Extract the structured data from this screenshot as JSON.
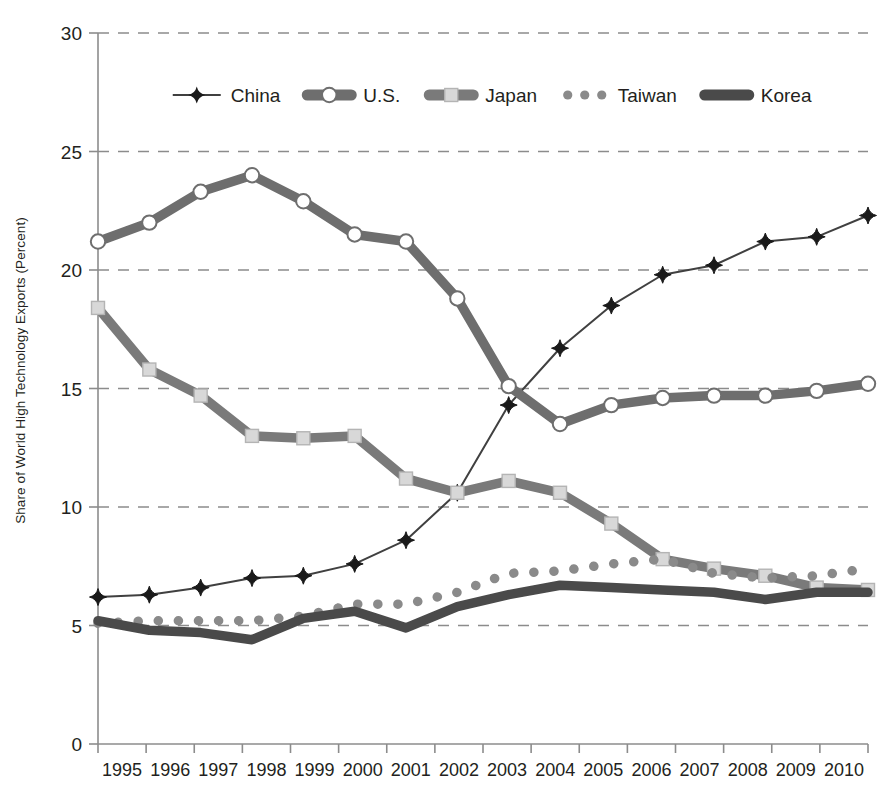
{
  "chart_data": {
    "type": "line",
    "title": "",
    "xlabel": "",
    "ylabel": "Share of World High Technology Exports (Percent)",
    "categories": [
      "1995",
      "1996",
      "1997",
      "1998",
      "1999",
      "2000",
      "2001",
      "2002",
      "2003",
      "2004",
      "2005",
      "2006",
      "2007",
      "2008",
      "2009",
      "2010"
    ],
    "x": [
      1995,
      1996,
      1997,
      1998,
      1999,
      2000,
      2001,
      2002,
      2003,
      2004,
      2005,
      2006,
      2007,
      2008,
      2009,
      2010
    ],
    "ylim": [
      0,
      30
    ],
    "xlim": [
      1995,
      2010
    ],
    "yticks": [
      0,
      5,
      10,
      15,
      20,
      25,
      30
    ],
    "ytick_labels": [
      "0",
      "5",
      "10",
      "15",
      "20",
      "25",
      "30"
    ],
    "grid": "horizontal-dashed",
    "legend_position": "top-center",
    "series": [
      {
        "name": "China",
        "color": "#404040",
        "marker": "diamond",
        "line_style": "thin-solid",
        "values": [
          6.2,
          6.3,
          6.6,
          7.0,
          7.1,
          7.6,
          8.6,
          10.6,
          14.3,
          16.7,
          18.5,
          19.8,
          20.2,
          21.2,
          21.4,
          22.3
        ]
      },
      {
        "name": "U.S.",
        "color": "#6e6e6e",
        "marker": "open-circle",
        "line_style": "thick-solid",
        "values": [
          21.2,
          22.0,
          23.3,
          24.0,
          22.9,
          21.5,
          21.2,
          18.8,
          15.1,
          13.5,
          14.3,
          14.6,
          14.7,
          14.7,
          14.9,
          15.2
        ]
      },
      {
        "name": "Japan",
        "color": "#7a7a7a",
        "marker": "square",
        "line_style": "thick-solid",
        "values": [
          18.4,
          15.8,
          14.7,
          13.0,
          12.9,
          13.0,
          11.2,
          10.6,
          11.1,
          10.6,
          9.3,
          7.8,
          7.4,
          7.1,
          6.6,
          6.5
        ]
      },
      {
        "name": "Taiwan",
        "color": "#8a8a8a",
        "marker": "dot",
        "line_style": "dotted",
        "values": [
          5.1,
          5.2,
          5.2,
          5.2,
          5.4,
          5.9,
          5.9,
          6.4,
          7.2,
          7.3,
          7.6,
          7.8,
          7.2,
          7.0,
          7.1,
          7.4
        ]
      },
      {
        "name": "Korea",
        "color": "#4a4a4a",
        "marker": "none",
        "line_style": "very-thick-solid",
        "values": [
          5.2,
          4.8,
          4.7,
          4.4,
          5.3,
          5.6,
          4.9,
          5.8,
          6.3,
          6.7,
          6.6,
          6.5,
          6.4,
          6.1,
          6.4,
          6.4
        ]
      }
    ]
  },
  "axis": {
    "y_title": "Share of World High Technology Exports (Percent)"
  },
  "legend": {
    "items": [
      {
        "label": "China"
      },
      {
        "label": "U.S."
      },
      {
        "label": "Japan"
      },
      {
        "label": "Taiwan"
      },
      {
        "label": "Korea"
      }
    ]
  },
  "colors": {
    "china": "#404040",
    "us": "#6e6e6e",
    "japan": "#7a7a7a",
    "taiwan": "#8a8a8a",
    "korea": "#4a4a4a",
    "axis": "#8c8c8c",
    "grid": "#8c8c8c",
    "text": "#231f20"
  }
}
